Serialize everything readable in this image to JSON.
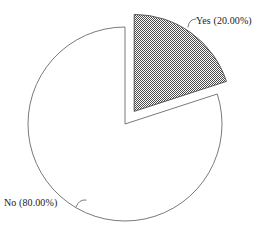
{
  "chart_data": {
    "type": "pie",
    "title": "",
    "subtitle": "",
    "xlabel": "",
    "ylabel": "",
    "legend_position": "none",
    "grid": false,
    "labels_inside": false,
    "start_angle_deg": 0,
    "direction": "clockwise",
    "categories": [
      "Yes",
      "No"
    ],
    "values": [
      20.0,
      80.0
    ],
    "units": "percent",
    "slices": [
      {
        "name": "Yes",
        "value": 20.0,
        "percent_text": "20.00%",
        "label": "Yes (20.00%)",
        "fill_style": "checkerboard-dither",
        "fill_color": "#808080",
        "edge_color": "#4d4d4d",
        "exploded": true,
        "start_angle_deg": 0,
        "end_angle_deg": 72
      },
      {
        "name": "No",
        "value": 80.0,
        "percent_text": "80.00%",
        "label": "No (80.00%)",
        "fill_style": "solid",
        "fill_color": "#ffffff",
        "edge_color": "#6b6b6b",
        "exploded": false,
        "start_angle_deg": 72,
        "end_angle_deg": 360
      }
    ]
  },
  "labels": {
    "yes": "Yes (20.00%)",
    "no": "No (80.00%)"
  },
  "colors": {
    "background": "#ffffff",
    "outline": "#6b6b6b",
    "hatch": "#808080",
    "text": "#1a1a1a",
    "leader": "#6b6b6b"
  }
}
